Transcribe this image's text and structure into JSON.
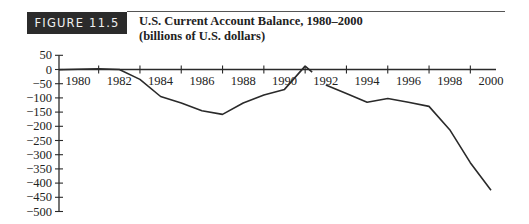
{
  "figure": {
    "label": "FIGURE 11.5",
    "title_line1": "U.S. Current Account Balance, 1980–2000",
    "title_line2": "(billions of U.S. dollars)"
  },
  "colors": {
    "label_bg": "#2b2b2b",
    "label_text": "#f0f0f0",
    "line": "#2a2a2a"
  },
  "chart_data": {
    "type": "line",
    "title": "U.S. Current Account Balance, 1980–2000",
    "subtitle": "(billions of U.S. dollars)",
    "xlabel": "",
    "ylabel": "",
    "ylim": [
      -500,
      50
    ],
    "yticks": [
      50,
      0,
      -50,
      -100,
      -150,
      -200,
      -250,
      -300,
      -350,
      -400,
      -450,
      -500
    ],
    "ytick_labels": [
      "50",
      "0",
      "−50",
      "−100",
      "−150",
      "−200",
      "−250",
      "−300",
      "−350",
      "−400",
      "−450",
      "−500"
    ],
    "xtick_labels": [
      "1980",
      "1982",
      "1984",
      "1986",
      "1988",
      "1990",
      "1992",
      "1994",
      "1996",
      "1998",
      "2000"
    ],
    "grid": false,
    "legend": null,
    "x": [
      1979,
      1980,
      1981,
      1982,
      1983,
      1984,
      1985,
      1986,
      1987,
      1988,
      1989,
      1990,
      1991,
      1992,
      1993,
      1994,
      1995,
      1996,
      1997,
      1998,
      1999,
      2000
    ],
    "series": [
      {
        "name": "U.S. Current Account Balance",
        "segments": [
          {
            "x": [
              1979,
              1980,
              1981,
              1982,
              1983,
              1984,
              1985,
              1986,
              1987,
              1988,
              1989,
              1990,
              1991
            ],
            "y": [
              -1,
              1,
              2,
              0,
              -35,
              -95,
              -118,
              -145,
              -158,
              -118,
              -90,
              -70,
              12
            ]
          },
          {
            "x": [
              1991
            ],
            "y": [
              12
            ]
          },
          {
            "x": [
              1992,
              1993,
              1994,
              1995,
              1996,
              1997,
              1998,
              1999,
              2000
            ],
            "y": [
              -55,
              -85,
              -115,
              -102,
              -115,
              -130,
              -212,
              -328,
              -425
            ]
          }
        ]
      }
    ]
  }
}
